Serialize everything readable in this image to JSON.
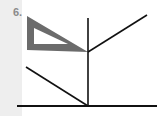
{
  "problem": {
    "number_label": "6."
  },
  "figure": {
    "colors": {
      "line": "#111111",
      "triangle_fill": "#6b6b6b",
      "triangle_hole": "#ffffff",
      "margin_strip": "#eeeeee",
      "label": "#8a8a8a"
    },
    "elements": {
      "triangle_outer": [
        [
          27,
          16
        ],
        [
          27,
          50
        ],
        [
          88,
          52
        ]
      ],
      "triangle_inner": [
        [
          34,
          28
        ],
        [
          34,
          44
        ],
        [
          68,
          44
        ]
      ],
      "vertical_line": {
        "x": 88,
        "y1": 18,
        "y2": 107
      },
      "upper_diagonal": {
        "x1": 88,
        "y1": 52,
        "x2": 147,
        "y2": 15
      },
      "lower_diagonal": {
        "x1": 26,
        "y1": 67,
        "x2": 88,
        "y2": 106
      },
      "base_line": {
        "x1": 17,
        "y1": 106,
        "x2": 157,
        "y2": 106
      }
    }
  }
}
